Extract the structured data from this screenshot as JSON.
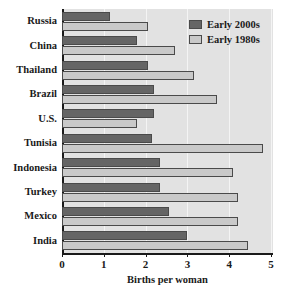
{
  "chart_data": {
    "type": "bar",
    "orientation": "horizontal",
    "title": "",
    "xlabel": "Births per woman",
    "ylabel": "",
    "xlim": [
      0,
      5
    ],
    "xticks": [
      0,
      1,
      2,
      3,
      4,
      5
    ],
    "xtick_labels": [
      "0",
      "1",
      "2",
      "3",
      "4",
      "5"
    ],
    "grid": "vertical",
    "legend_position": "top-right",
    "categories": [
      "Russia",
      "China",
      "Thailand",
      "Brazil",
      "U.S.",
      "Tunisia",
      "Indonesia",
      "Turkey",
      "Mexico",
      "India"
    ],
    "series": [
      {
        "name": "Early 2000s",
        "color": "#656565",
        "values": [
          1.15,
          1.8,
          2.05,
          2.2,
          2.2,
          2.15,
          2.35,
          2.35,
          2.55,
          3.0
        ]
      },
      {
        "name": "Early 1980s",
        "color": "#c9c9c9",
        "values": [
          2.05,
          2.7,
          3.15,
          3.7,
          1.8,
          4.8,
          4.1,
          4.2,
          4.2,
          4.45
        ]
      }
    ]
  },
  "legend": {
    "items": [
      {
        "label": "Early 2000s"
      },
      {
        "label": "Early 1980s"
      }
    ]
  },
  "colors": {
    "series_early_2000s": "#656565",
    "series_early_1980s": "#c9c9c9",
    "plot_background": "#e2e2e2",
    "axis": "#1a1a1a",
    "gridline": "#f4f4f4"
  }
}
